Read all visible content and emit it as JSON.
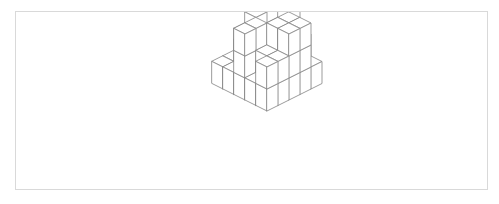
{
  "figure": {
    "kind": "line-art-isometric-solid",
    "panel": {
      "background_color": "#ffffff",
      "border_color": "#d9d9d9",
      "border_width_px": 1,
      "x": 15,
      "y": 11,
      "width": 473,
      "height": 179
    },
    "rendering": {
      "line_color": "#8a8a8a",
      "line_width_px": 0.85,
      "face_fill_color": "#ffffff",
      "cube_half_width_px": 11,
      "cube_half_depth_px": 5.5,
      "cube_height_px": 22,
      "origin_x_px": 251,
      "origin_y_px": 44
    },
    "grid": {
      "columns": 5,
      "rows": 5,
      "max_stack_height": 4,
      "note": "heightmap[row][col] = number of unit cubes stacked at that grid cell; row index increases toward the lower-left, col index increases toward the lower-right"
    },
    "heightmap": [
      [
        1,
        2,
        4,
        2,
        1
      ],
      [
        1,
        2,
        2,
        3,
        3
      ],
      [
        2,
        3,
        2,
        3,
        3
      ],
      [
        1,
        2,
        3,
        2,
        2
      ],
      [
        1,
        1,
        3,
        1,
        2
      ]
    ],
    "cube_count_total": 54,
    "caption": ""
  }
}
